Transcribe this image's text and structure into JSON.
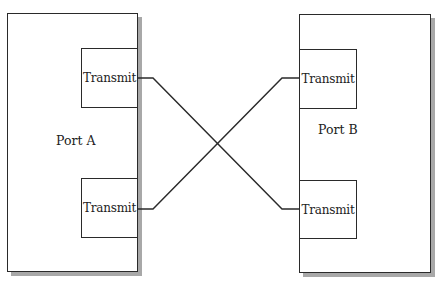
{
  "diagram": {
    "type": "crossover-connection",
    "ports": [
      {
        "id": "port-a",
        "label": "Port A",
        "transmitters": [
          {
            "label": "Transmit",
            "position": "top"
          },
          {
            "label": "Transmit",
            "position": "bottom"
          }
        ]
      },
      {
        "id": "port-b",
        "label": "Port B",
        "transmitters": [
          {
            "label": "Transmit",
            "position": "top"
          },
          {
            "label": "Transmit",
            "position": "bottom"
          }
        ]
      }
    ],
    "connections": [
      {
        "from": "Port A top Transmit",
        "to": "Port B bottom Transmit"
      },
      {
        "from": "Port A bottom Transmit",
        "to": "Port B top Transmit"
      }
    ],
    "colors": {
      "line": "#2a2a2a",
      "shadow": "#a8a8a8",
      "background": "#ffffff"
    }
  }
}
